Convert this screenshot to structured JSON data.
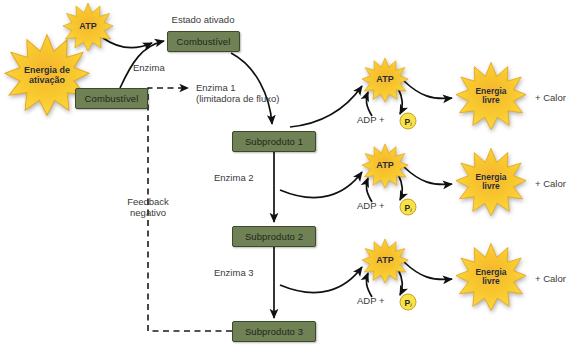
{
  "diagram": {
    "title_label": "Estado ativado",
    "colors": {
      "box_fill": "#6f8155",
      "box_stroke": "#3c4a2c",
      "star_outer": "#fcd93a",
      "star_inner": "#f0a92b",
      "star_stroke": "#e0a91f",
      "arrow": "#111111",
      "text": "#3a3a3a",
      "pi_fill": "#f7e249",
      "pi_stroke": "#c9a227"
    },
    "boxes": [
      {
        "id": "combustivel-inicial",
        "label": "Combustível"
      },
      {
        "id": "combustivel-ativado",
        "label": "Combustível"
      },
      {
        "id": "subproduto-1",
        "label": "Subproduto 1"
      },
      {
        "id": "subproduto-2",
        "label": "Subproduto 2"
      },
      {
        "id": "subproduto-3",
        "label": "Subproduto 3"
      }
    ],
    "stars": [
      {
        "id": "energia-ativacao",
        "line1": "Energia de",
        "line2": "ativação"
      },
      {
        "id": "atp-top",
        "line1": "ATP",
        "line2": ""
      },
      {
        "id": "atp-1",
        "line1": "ATP",
        "line2": ""
      },
      {
        "id": "atp-2",
        "line1": "ATP",
        "line2": ""
      },
      {
        "id": "atp-3",
        "line1": "ATP",
        "line2": ""
      },
      {
        "id": "energia-livre-1",
        "line1": "Energia",
        "line2": "livre"
      },
      {
        "id": "energia-livre-2",
        "line1": "Energia",
        "line2": "livre"
      },
      {
        "id": "energia-livre-3",
        "line1": "Energia",
        "line2": "livre"
      }
    ],
    "labels": {
      "estado_ativado": "Estado ativado",
      "enzima": "Enzima",
      "enzima_1_line1": "Enzima 1",
      "enzima_1_line2": "(limitadora de fluxo)",
      "enzima_2": "Enzima 2",
      "enzima_3": "Enzima 3",
      "feedback_line1": "Feedback",
      "feedback_line2": "negativo",
      "adp_1": "ADP +",
      "adp_2": "ADP +",
      "adp_3": "ADP +",
      "pi_1": "P",
      "pi_2": "P",
      "pi_3": "P",
      "pi_sub": "i",
      "calor_1": "+ Calor",
      "calor_2": "+ Calor",
      "calor_3": "+ Calor"
    }
  }
}
